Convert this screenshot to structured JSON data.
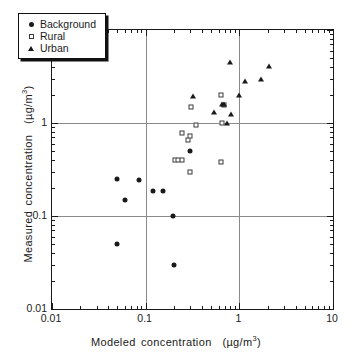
{
  "chart_data": {
    "type": "scatter",
    "title": "",
    "xlabel": "Modeled concentration (µg/m³)",
    "ylabel": "Measured concentration (µg/m³)",
    "xlabel_text": "Modeled concentration",
    "xlabel_units": "(µg/m",
    "ylabel_text": "Measured concentration",
    "xscale": "log",
    "yscale": "log",
    "xlim": [
      0.01,
      10
    ],
    "ylim": [
      0.01,
      10
    ],
    "grid": true,
    "grid_lines_x": [
      0.1,
      1
    ],
    "grid_lines_y": [
      0.1,
      1
    ],
    "legend_position": "top-left",
    "xticks": [
      "0.01",
      "0.1",
      "1",
      "10"
    ],
    "xtick_values": [
      0.01,
      0.1,
      1,
      10
    ],
    "yticks": [
      "0.01",
      "0.1",
      "1",
      "10"
    ],
    "ytick_values": [
      0.01,
      0.1,
      1,
      10
    ],
    "series": [
      {
        "name": "Background",
        "marker": "filled-circle",
        "color": "#1a1a1a",
        "points": [
          [
            0.05,
            0.25
          ],
          [
            0.06,
            0.15
          ],
          [
            0.05,
            0.05
          ],
          [
            0.085,
            0.245
          ],
          [
            0.12,
            0.185
          ],
          [
            0.155,
            0.185
          ],
          [
            0.195,
            0.1
          ],
          [
            0.2,
            0.03
          ],
          [
            0.3,
            0.5
          ]
        ]
      },
      {
        "name": "Rural",
        "marker": "open-square",
        "color": "#3a3a3a",
        "points": [
          [
            0.205,
            0.4
          ],
          [
            0.22,
            0.4
          ],
          [
            0.245,
            0.405
          ],
          [
            0.245,
            0.79
          ],
          [
            0.28,
            0.65
          ],
          [
            0.295,
            0.72
          ],
          [
            0.3,
            0.3
          ],
          [
            0.305,
            1.5
          ],
          [
            0.345,
            0.95
          ],
          [
            0.64,
            2.0
          ],
          [
            0.64,
            0.38
          ],
          [
            0.65,
            0.99
          ],
          [
            0.68,
            1.55
          ]
        ]
      },
      {
        "name": "Urban",
        "marker": "filled-triangle",
        "color": "#1a1a1a",
        "points": [
          [
            0.32,
            1.95
          ],
          [
            0.54,
            1.32
          ],
          [
            0.66,
            1.6
          ],
          [
            0.68,
            1.62
          ],
          [
            0.74,
            0.99
          ],
          [
            0.79,
            4.5
          ],
          [
            0.82,
            1.25
          ],
          [
            0.98,
            2.0
          ],
          [
            1.15,
            2.8
          ],
          [
            1.7,
            3.0
          ],
          [
            2.05,
            4.15
          ]
        ]
      }
    ]
  },
  "legend": {
    "items": [
      {
        "label": "Background",
        "marker": "filled-circle"
      },
      {
        "label": "Rural",
        "marker": "open-square"
      },
      {
        "label": "Urban",
        "marker": "filled-triangle"
      }
    ]
  },
  "axes": {
    "x": {
      "label_main": "Modeled concentration",
      "units_open": "(µg/m",
      "units_exp": "3",
      "units_close": ")"
    },
    "y": {
      "label_main": "Measured concentration",
      "units_open": "(µg/m",
      "units_exp": "3",
      "units_close": ")"
    }
  }
}
